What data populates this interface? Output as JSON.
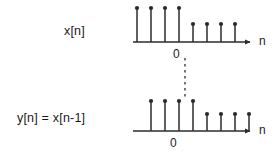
{
  "figure": {
    "background_color": "#ffffff",
    "ink_color": "#2b2b2b",
    "text_color": "#1a1a1a",
    "width": 277,
    "height": 162
  },
  "plots": {
    "top": {
      "signal_label": "x[n]",
      "axis_label": "n",
      "origin_label": "0"
    },
    "bottom": {
      "signal_label": "y[n] = x[n-1]",
      "axis_label": "n",
      "origin_label": "0"
    }
  },
  "chart_data": {
    "type": "line",
    "title": "",
    "subtitle": "",
    "xlabel": "n",
    "ylabel": "",
    "grid": false,
    "legend_position": "none",
    "plot_style": "stem",
    "panels": [
      {
        "name": "x[n]",
        "label": "x[n]",
        "origin_label": "0",
        "axis_label": "n",
        "axis_y_px": 42,
        "axis_x_start_px": 133,
        "axis_x_end_px": 250,
        "sample_spacing_px": 14,
        "x": [
          -3,
          -2,
          -1,
          0,
          1,
          2,
          3,
          4
        ],
        "values": [
          1.0,
          1.0,
          1.0,
          1.0,
          0.53,
          0.53,
          0.53,
          0.53
        ],
        "stem_x_px": [
          137,
          151,
          165,
          179,
          193,
          207,
          221,
          235
        ],
        "stem_top_px": [
          8,
          8,
          8,
          8,
          24,
          24,
          24,
          24
        ],
        "origin_x_px": 179,
        "ylim": [
          0,
          1.15
        ]
      },
      {
        "name": "y[n] = x[n-1]",
        "label": "y[n] = x[n-1]",
        "origin_label": "0",
        "axis_label": "n",
        "axis_y_px": 131,
        "axis_x_start_px": 133,
        "axis_x_end_px": 250,
        "sample_spacing_px": 14,
        "x": [
          -2,
          -1,
          0,
          1,
          2,
          3,
          4,
          5
        ],
        "values": [
          1.0,
          1.0,
          1.0,
          1.0,
          0.53,
          0.53,
          0.53,
          0.53
        ],
        "stem_x_px": [
          151,
          165,
          179,
          193,
          207,
          221,
          235,
          249
        ],
        "stem_top_px": [
          101,
          101,
          101,
          101,
          114,
          114,
          114,
          114
        ],
        "origin_x_px": 179,
        "ylim": [
          0,
          1.15
        ]
      }
    ],
    "annotations": [
      {
        "name": "shift-guide-dashed-line",
        "style": "dashed-vertical",
        "x_px": 185,
        "y_start_px": 58,
        "y_end_px": 100
      }
    ]
  }
}
